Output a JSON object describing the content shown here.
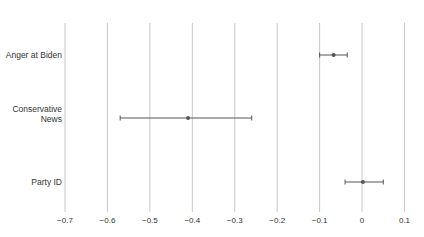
{
  "chart_data": {
    "type": "scatter",
    "subtype": "coefficient_plot_with_error_bars",
    "title": "",
    "xlabel": "",
    "ylabel": "",
    "xlim": [
      -0.7,
      0.1
    ],
    "grid": "vertical",
    "legend": null,
    "x_ticks": [
      "−0.7",
      "−0.6",
      "−0.5",
      "−0.4",
      "−0.3",
      "−0.2",
      "−0.1",
      "0",
      "0.1"
    ],
    "x_tick_values": [
      -0.7,
      -0.6,
      -0.5,
      -0.4,
      -0.3,
      -0.2,
      -0.1,
      0,
      0.1
    ],
    "categories": [
      "Anger at Biden",
      "Conservative\nNews",
      "Party ID"
    ],
    "series": [
      {
        "name": "Estimate",
        "values": [
          -0.067,
          -0.41,
          0.002
        ],
        "ci_low": [
          -0.1,
          -0.57,
          -0.04
        ],
        "ci_high": [
          -0.035,
          -0.26,
          0.05
        ]
      }
    ],
    "colors": {
      "point": "#555555",
      "errorbar": "#555555",
      "grid": "#c8c8c8"
    }
  }
}
